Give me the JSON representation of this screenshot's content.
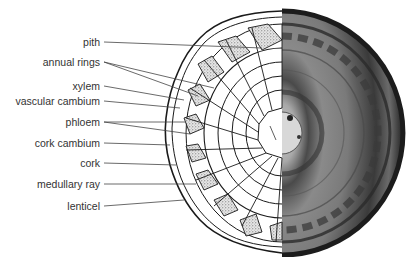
{
  "diagram": {
    "labels": [
      {
        "id": "pith",
        "text": "pith",
        "y": 42
      },
      {
        "id": "annual-rings",
        "text": "annual rings",
        "y": 62
      },
      {
        "id": "xylem",
        "text": "xylem",
        "y": 86
      },
      {
        "id": "vascular-cambium",
        "text": "vascular cambium",
        "y": 101
      },
      {
        "id": "phloem",
        "text": "phloem",
        "y": 122
      },
      {
        "id": "cork-cambium",
        "text": "cork cambium",
        "y": 143
      },
      {
        "id": "cork",
        "text": "cork",
        "y": 163
      },
      {
        "id": "medullary-ray",
        "text": "medullary ray",
        "y": 184
      },
      {
        "id": "lenticel",
        "text": "lenticel",
        "y": 206
      }
    ],
    "colors": {
      "line": "#1a1a1a",
      "label_text": "#333333",
      "leader": "#444444",
      "stipple": "#9a9a9a",
      "photo_dark": "#2b2b2b",
      "photo_mid": "#6e6e6e",
      "photo_light": "#bdbdbd"
    }
  }
}
